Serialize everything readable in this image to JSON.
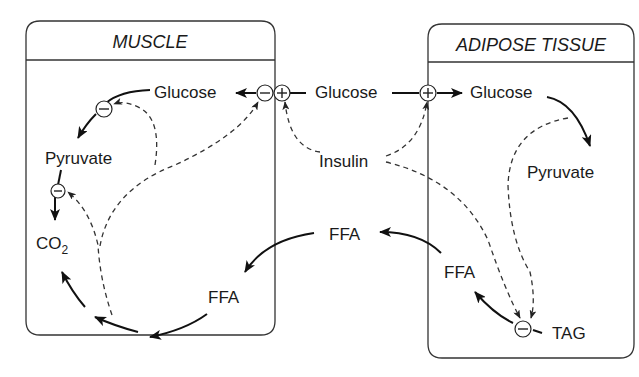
{
  "diagram": {
    "compartments": [
      {
        "id": "muscle",
        "title": "MUSCLE"
      },
      {
        "id": "adipose",
        "title": "ADIPOSE TISSUE"
      }
    ],
    "labels": {
      "muscle_glucose": "Glucose",
      "muscle_pyruvate": "Pyruvate",
      "muscle_co2_main": "CO",
      "muscle_co2_sub": "2",
      "muscle_ffa": "FFA",
      "blood_glucose": "Glucose",
      "blood_insulin": "Insulin",
      "blood_ffa": "FFA",
      "adipose_glucose": "Glucose",
      "adipose_pyruvate": "Pyruvate",
      "adipose_ffa": "FFA",
      "adipose_tag": "TAG"
    },
    "regulators": [
      {
        "id": "muscle-glucose-uptake-inhibit",
        "sign": "−"
      },
      {
        "id": "muscle-glucose-uptake-stimulate",
        "sign": "+"
      },
      {
        "id": "adipose-glucose-uptake-stimulate",
        "sign": "+"
      },
      {
        "id": "muscle-glycolysis-inhibit",
        "sign": "−"
      },
      {
        "id": "muscle-pyruvate-oxidation-inhibit",
        "sign": "−"
      },
      {
        "id": "adipose-lipolysis-inhibit",
        "sign": "−"
      }
    ],
    "edges": [
      {
        "from": "Glucose (blood)",
        "to": "Glucose (muscle)",
        "style": "solid"
      },
      {
        "from": "Glucose (blood)",
        "to": "Glucose (adipose)",
        "style": "solid"
      },
      {
        "from": "Glucose (muscle)",
        "to": "Pyruvate (muscle)",
        "style": "solid"
      },
      {
        "from": "Pyruvate (muscle)",
        "to": "CO2",
        "style": "solid"
      },
      {
        "from": "Glucose (adipose)",
        "to": "Pyruvate (adipose)",
        "style": "solid"
      },
      {
        "from": "TAG",
        "to": "FFA (adipose)",
        "style": "solid"
      },
      {
        "from": "FFA (adipose)",
        "to": "FFA (blood)",
        "style": "solid"
      },
      {
        "from": "FFA (blood)",
        "to": "FFA (muscle)",
        "style": "solid"
      },
      {
        "from": "FFA (muscle)",
        "to": "CO2",
        "style": "solid"
      },
      {
        "from": "Insulin",
        "to": "muscle glucose uptake (+)",
        "style": "dashed"
      },
      {
        "from": "Insulin",
        "to": "adipose glucose uptake (+)",
        "style": "dashed"
      },
      {
        "from": "Insulin",
        "to": "lipolysis (−)",
        "style": "dashed"
      },
      {
        "from": "Glucose (adipose)",
        "to": "lipolysis (−)",
        "style": "dashed"
      },
      {
        "from": "FFA oxidation (muscle)",
        "to": "glucose uptake (−)",
        "style": "dashed"
      },
      {
        "from": "FFA oxidation (muscle)",
        "to": "glycolysis (−)",
        "style": "dashed"
      },
      {
        "from": "FFA oxidation (muscle)",
        "to": "pyruvate oxidation (−)",
        "style": "dashed"
      }
    ]
  }
}
